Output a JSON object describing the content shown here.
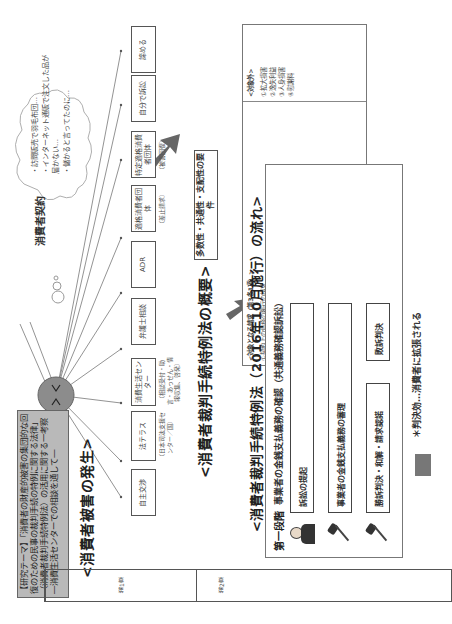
{
  "research_theme": "【研究テーマ】「消費者の財産的被害の集団的な回復のための民事の裁判手続の特例に関する法律」（消費者裁判手続特例法）の活用に関する一考察 ―消費生活センターでの相談を通して―",
  "sections": {
    "occurrence": "<消費者被害の発生>",
    "overview": "<消費者裁判手続特例法の概要>",
    "flow": "<消費者裁判手続特例法（2016年10月施行）の流れ>"
  },
  "contract": {
    "label": "消費者契約",
    "thought_bubble": [
      "・訪問販売で羽毛布団…",
      "・インターネット通販で注文した品が届かない…",
      "・儲かると言ってたのに…"
    ]
  },
  "remedies": [
    {
      "label": "自主交渉",
      "note": ""
    },
    {
      "label": "法テラス",
      "note": "（日本司法支援センター／国）"
    },
    {
      "label": "消費生活センター",
      "note": "（相談受付・助言・あっせん・情報収集、啓発）"
    },
    {
      "label": "弁護士相談",
      "note": ""
    },
    {
      "label": "ADR",
      "note": ""
    },
    {
      "label": "適格消費者団体",
      "note": "（差止請求）"
    },
    {
      "label": "特定適格消費者団体",
      "note": "（被害回復）"
    },
    {
      "label": "自分で訴訟",
      "note": ""
    },
    {
      "label": "諦める",
      "note": ""
    }
  ],
  "requirements": "多数性・共通性・支配性の要件",
  "claims": {
    "covered_title": "<対象となる請求（第3条1項）>",
    "covered": [
      "①契約上の債務の履行の請求",
      "②不当利得に係る請求",
      "③契約上の債務の不履行による損害賠償の請求",
      "④瑕疵担保責任に基づく損害賠償の請求",
      "⑤不法行為に基づく民法の規定による損害賠償の請求"
    ],
    "excluded_title": "<対象外>",
    "excluded": [
      "①拡大損害",
      "②逸失利益",
      "③人身損害",
      "④慰謝料"
    ]
  },
  "flow": {
    "stage_label": "第一段階",
    "stage_title": "事業者の金銭支払義務の確認（共通義務確認訴訟）",
    "steps": [
      "訴訟の提起",
      "事業者の金銭支払義務の審理"
    ],
    "outcome_win": "勝訴判決・和解・請求認諾",
    "outcome_lose": "敗訴判決",
    "note": "＊判決効…消費者に拡張される"
  },
  "toc": [
    "第1章",
    "第2章"
  ]
}
